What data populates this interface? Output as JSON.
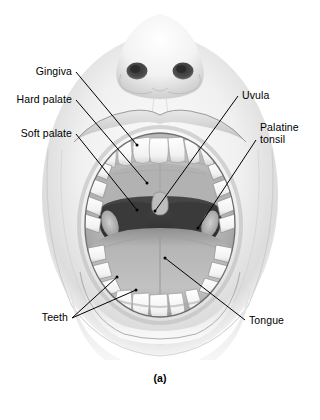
{
  "figure": {
    "name": "oral-cavity-anatomy",
    "caption": "(a)",
    "background_color": "#ffffff",
    "line_color": "#000000",
    "label_color": "#000000"
  },
  "labels": {
    "gingiva": "Gingiva",
    "hard_palate": "Hard palate",
    "soft_palate": "Soft palate",
    "uvula": "Uvula",
    "palatine_tonsil_line1": "Palatine",
    "palatine_tonsil_line2": "tonsil",
    "teeth": "Teeth",
    "tongue": "Tongue"
  },
  "annotations": [
    {
      "id": "gingiva",
      "text": "Gingiva",
      "side": "left",
      "label_x": 72,
      "label_y": 72,
      "leader_end_x": 137,
      "leader_end_y": 145
    },
    {
      "id": "hard-palate",
      "text": "Hard palate",
      "side": "left",
      "label_x": 72,
      "label_y": 99,
      "leader_end_x": 147,
      "leader_end_y": 183
    },
    {
      "id": "soft-palate",
      "text": "Soft palate",
      "side": "left",
      "label_x": 72,
      "label_y": 131,
      "leader_end_x": 137,
      "leader_end_y": 210
    },
    {
      "id": "uvula",
      "text": "Uvula",
      "side": "right",
      "label_x": 240,
      "label_y": 94,
      "leader_end_x": 155,
      "leader_end_y": 211
    },
    {
      "id": "palatine-tonsil",
      "text": "Palatine tonsil",
      "side": "right",
      "label_x": 262,
      "label_y": 128,
      "leader_end_x": 198,
      "leader_end_y": 228
    },
    {
      "id": "teeth",
      "text": "Teeth",
      "side": "left",
      "label_x": 66,
      "label_y": 317,
      "leader_end_x": 117,
      "leader_end_y": 277
    },
    {
      "id": "tongue",
      "text": "Tongue",
      "side": "right",
      "label_x": 250,
      "label_y": 321,
      "leader_end_x": 165,
      "leader_end_y": 258
    }
  ],
  "structures": [
    {
      "id": "nose",
      "name": "nose"
    },
    {
      "id": "nostril-left",
      "name": "left nostril"
    },
    {
      "id": "nostril-right",
      "name": "right nostril"
    },
    {
      "id": "upper-lip",
      "name": "upper lip"
    },
    {
      "id": "lower-lip",
      "name": "lower lip"
    },
    {
      "id": "chin",
      "name": "chin"
    },
    {
      "id": "upper-incisors",
      "name": "upper incisors"
    },
    {
      "id": "lower-incisors",
      "name": "lower incisors"
    },
    {
      "id": "upper-molars-left",
      "name": "upper left molars"
    },
    {
      "id": "upper-molars-right",
      "name": "upper right molars"
    },
    {
      "id": "lower-molars-left",
      "name": "lower left molars"
    },
    {
      "id": "lower-molars-right",
      "name": "lower right molars"
    },
    {
      "id": "hard-palate",
      "name": "hard palate"
    },
    {
      "id": "soft-palate",
      "name": "soft palate"
    },
    {
      "id": "uvula",
      "name": "uvula"
    },
    {
      "id": "oropharynx",
      "name": "oropharynx"
    },
    {
      "id": "tongue",
      "name": "tongue"
    },
    {
      "id": "palatine-tonsil-left",
      "name": "left palatine tonsil"
    },
    {
      "id": "palatine-tonsil-right",
      "name": "right palatine tonsil"
    }
  ],
  "colors": {
    "skin_light": "#f2f2f2",
    "skin_mid": "#d8d8d8",
    "skin_shadow": "#b4b4b4",
    "tooth": "#fbfbfb",
    "tooth_shadow": "#cfcfcf",
    "palate": "#b8b8b8",
    "palate_shadow": "#9a9a9a",
    "tongue": "#b0b0b0",
    "throat_dark": "#3d3d3d",
    "throat_darker": "#2b2b2b",
    "nostril": "#4a4a4a",
    "outline": "#000000"
  }
}
